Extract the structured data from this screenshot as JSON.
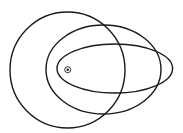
{
  "diagram": {
    "width": 183,
    "height": 133,
    "background": "#ffffff",
    "stroke_color": "#1a1a1a",
    "stroke_width": 1.4,
    "orbits": [
      {
        "name": "circular-orbit",
        "cx": 67.5,
        "cy": 70,
        "rx": 57.5,
        "ry": 58
      },
      {
        "name": "medium-ellipse-orbit",
        "cx": 103.5,
        "cy": 69.5,
        "rx": 57.5,
        "ry": 44.5
      },
      {
        "name": "narrow-ellipse-orbit",
        "cx": 114.8,
        "cy": 68.5,
        "rx": 57.8,
        "ry": 24.5
      }
    ],
    "focus": {
      "cx": 67.7,
      "cy": 69.7,
      "ring_r": 3,
      "dot_r": 1.2
    }
  }
}
